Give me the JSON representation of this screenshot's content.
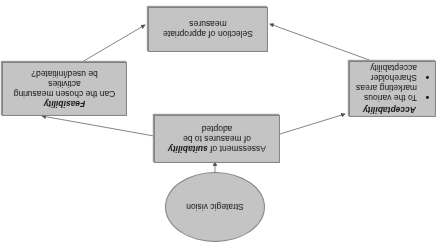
{
  "diagram": {
    "orientation": "rotated 180 degrees",
    "ellipse": {
      "label": "Strategic vision"
    },
    "suitability": {
      "line1_pre": "Assessment of ",
      "line1_bold": "suitability",
      "line2": "of measures to be",
      "line3": "adopted"
    },
    "feasibility": {
      "title": "Feasibility",
      "line1": "Can the chosen measuring",
      "line2": "activities",
      "line3": "be used/initiated?"
    },
    "acceptability": {
      "title": "Acceptability",
      "bullets": [
        "To the various marketing areas",
        "Shareholder acceptability"
      ]
    },
    "selection": {
      "line1": "Selection of appropriate",
      "line2": "measures"
    },
    "colors": {
      "box_fill": "#c4c4c4",
      "border": "#7f7f7f",
      "arrow": "#555555"
    }
  }
}
